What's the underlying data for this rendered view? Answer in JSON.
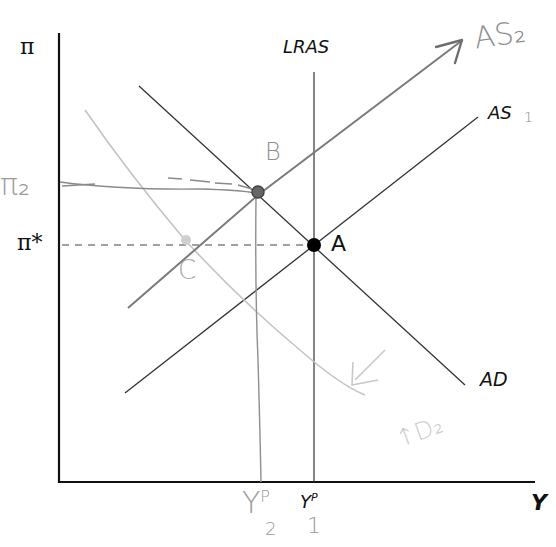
{
  "diagram": {
    "type": "AS-AD model (inflation vs output)",
    "axes": {
      "y_label": "π",
      "x_label": "Y"
    },
    "printed_labels": {
      "lras": "LRAS",
      "as1": "AS",
      "ad": "AD",
      "pi_star": "π*",
      "point_a": "A",
      "y_potential": "Y",
      "y_potential_sup": "P"
    },
    "handwritten_labels": {
      "as2": "AS₂",
      "as1_subscript": "1",
      "pi2": "π₂",
      "point_b": "B",
      "point_c": "C",
      "ad2": "↑D₂",
      "y2": "Y",
      "y2_sup": "P",
      "y2_sub": "2",
      "y1_sub": "1"
    },
    "colors": {
      "axis": "#111111",
      "printed_line": "#333333",
      "hand_dark": "#6e6e6e",
      "hand_light": "#bdbdbd",
      "point": "#000000"
    }
  }
}
